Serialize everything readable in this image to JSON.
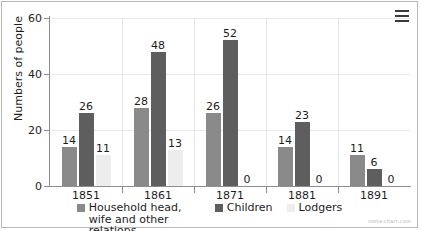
{
  "menu": {
    "icon": "hamburger-menu-icon",
    "label": "Chart menu"
  },
  "watermark": "meta-chart.com",
  "legend": {
    "position": "bottom-center",
    "items": [
      {
        "label": "Household head, wife and other relations",
        "color": "#8a8a8a"
      },
      {
        "label": "Children",
        "color": "#5e5e5e"
      },
      {
        "label": "Lodgers",
        "color": "#ededed"
      }
    ]
  },
  "chart_data": {
    "type": "bar",
    "title": "",
    "xlabel": "",
    "ylabel": "Numbers of people",
    "ylim": [
      0,
      60
    ],
    "yticks": [
      0,
      20,
      40,
      60
    ],
    "grid": true,
    "categories": [
      "1851",
      "1861",
      "1871",
      "1881",
      "1891"
    ],
    "series": [
      {
        "name": "Household head, wife and other relations",
        "color": "#8a8a8a",
        "values": [
          14,
          28,
          26,
          14,
          11
        ]
      },
      {
        "name": "Children",
        "color": "#5e5e5e",
        "values": [
          26,
          48,
          52,
          23,
          6
        ]
      },
      {
        "name": "Lodgers",
        "color": "#ededed",
        "values": [
          11,
          13,
          0,
          0,
          0
        ]
      }
    ]
  }
}
